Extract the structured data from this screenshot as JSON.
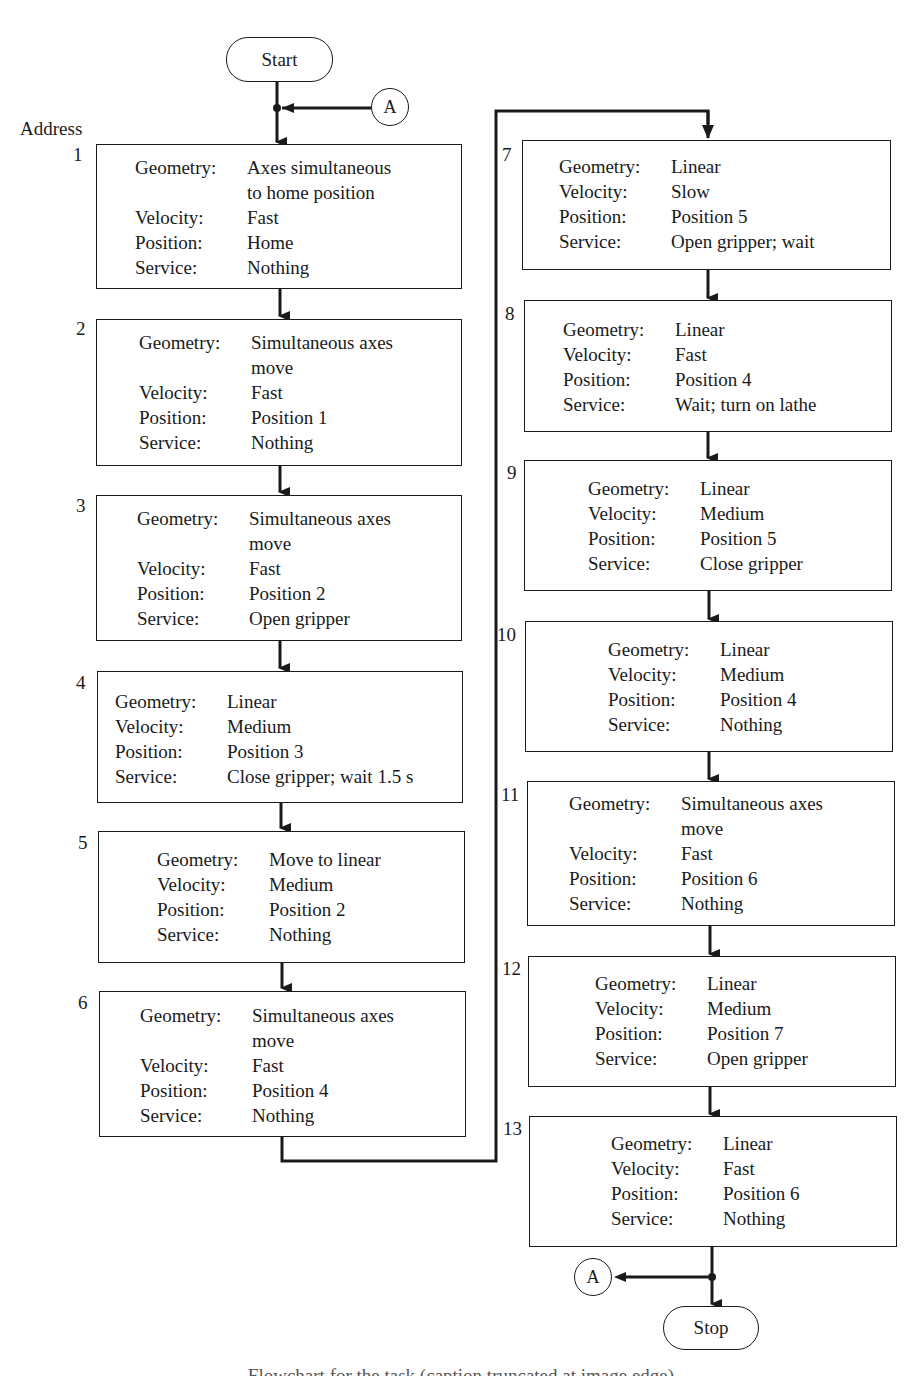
{
  "flowchart": {
    "start_label": "Start",
    "stop_label": "Stop",
    "connector_label": "A",
    "address_heading": "Address",
    "field_labels": {
      "geometry": "Geometry:",
      "velocity": "Velocity:",
      "position": "Position:",
      "service": "Service:"
    },
    "steps": [
      {
        "address": "1",
        "geometry": [
          "Axes simultaneous",
          "to home position"
        ],
        "velocity": "Fast",
        "position": "Home",
        "service": "Nothing"
      },
      {
        "address": "2",
        "geometry": [
          "Simultaneous axes",
          "move"
        ],
        "velocity": "Fast",
        "position": "Position 1",
        "service": "Nothing"
      },
      {
        "address": "3",
        "geometry": [
          "Simultaneous axes",
          "move"
        ],
        "velocity": "Fast",
        "position": "Position 2",
        "service": "Open gripper"
      },
      {
        "address": "4",
        "geometry": [
          "Linear"
        ],
        "velocity": "Medium",
        "position": "Position 3",
        "service": "Close gripper; wait 1.5 s"
      },
      {
        "address": "5",
        "geometry": [
          "Move to linear"
        ],
        "velocity": "Medium",
        "position": "Position 2",
        "service": "Nothing"
      },
      {
        "address": "6",
        "geometry": [
          "Simultaneous axes",
          "move"
        ],
        "velocity": "Fast",
        "position": "Position 4",
        "service": "Nothing"
      },
      {
        "address": "7",
        "geometry": [
          "Linear"
        ],
        "velocity": "Slow",
        "position": "Position 5",
        "service": "Open gripper; wait"
      },
      {
        "address": "8",
        "geometry": [
          "Linear"
        ],
        "velocity": "Fast",
        "position": "Position 4",
        "service": "Wait; turn on lathe"
      },
      {
        "address": "9",
        "geometry": [
          "Linear"
        ],
        "velocity": "Medium",
        "position": "Position 5",
        "service": "Close gripper"
      },
      {
        "address": "10",
        "geometry": [
          "Linear"
        ],
        "velocity": "Medium",
        "position": "Position 4",
        "service": "Nothing"
      },
      {
        "address": "11",
        "geometry": [
          "Simultaneous axes",
          "move"
        ],
        "velocity": "Fast",
        "position": "Position 6",
        "service": "Nothing"
      },
      {
        "address": "12",
        "geometry": [
          "Linear"
        ],
        "velocity": "Medium",
        "position": "Position 7",
        "service": "Open gripper"
      },
      {
        "address": "13",
        "geometry": [
          "Linear"
        ],
        "velocity": "Fast",
        "position": "Position 6",
        "service": "Nothing"
      }
    ]
  },
  "caption": {
    "text": "Flowchart for the task (caption truncated at image edge)"
  }
}
